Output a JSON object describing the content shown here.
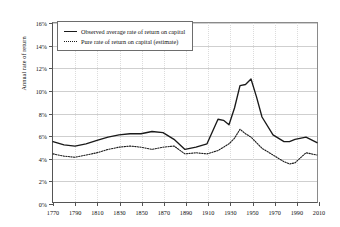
{
  "chart_data": {
    "type": "line",
    "title": "",
    "xlabel": "",
    "ylabel": "Annual rate of return",
    "xlim": [
      1770,
      2010
    ],
    "ylim": [
      0,
      16
    ],
    "grid": true,
    "legend_position": "top-left",
    "ytick_labels": [
      "0%",
      "2%",
      "4%",
      "6%",
      "8%",
      "10%",
      "12%",
      "14%",
      "16%"
    ],
    "ytick_values": [
      0,
      2,
      4,
      6,
      8,
      10,
      12,
      14,
      16
    ],
    "xtick_labels": [
      "1770",
      "1790",
      "1810",
      "1830",
      "1850",
      "1870",
      "1890",
      "1910",
      "1930",
      "1950",
      "1970",
      "1990",
      "2010"
    ],
    "xtick_values": [
      1770,
      1790,
      1810,
      1830,
      1850,
      1870,
      1890,
      1910,
      1930,
      1950,
      1970,
      1990,
      2010
    ],
    "x": [
      1770,
      1780,
      1790,
      1800,
      1810,
      1820,
      1830,
      1840,
      1850,
      1860,
      1870,
      1880,
      1890,
      1900,
      1910,
      1920,
      1925,
      1930,
      1935,
      1940,
      1945,
      1950,
      1955,
      1960,
      1970,
      1980,
      1985,
      1990,
      2000,
      2010
    ],
    "series": [
      {
        "name": "Observed average rate of return on capital",
        "style": "solid",
        "color": "#1a1a1a",
        "values": [
          5.4,
          5.1,
          5.0,
          5.2,
          5.5,
          5.8,
          6.0,
          6.1,
          6.1,
          6.3,
          6.2,
          5.6,
          4.7,
          4.9,
          5.2,
          7.4,
          7.3,
          6.9,
          8.4,
          10.4,
          10.5,
          11.0,
          9.4,
          7.6,
          6.0,
          5.4,
          5.4,
          5.6,
          5.8,
          5.3
        ]
      },
      {
        "name": "Pure rate of return on capital (estimate)",
        "style": "dotted",
        "color": "#1a1a1a",
        "values": [
          4.3,
          4.1,
          4.0,
          4.2,
          4.4,
          4.7,
          4.9,
          5.0,
          4.9,
          4.7,
          4.9,
          5.0,
          4.3,
          4.4,
          4.3,
          4.6,
          4.9,
          5.2,
          5.7,
          6.5,
          6.1,
          5.8,
          5.3,
          4.8,
          4.2,
          3.6,
          3.4,
          3.5,
          4.4,
          4.2
        ]
      }
    ]
  }
}
